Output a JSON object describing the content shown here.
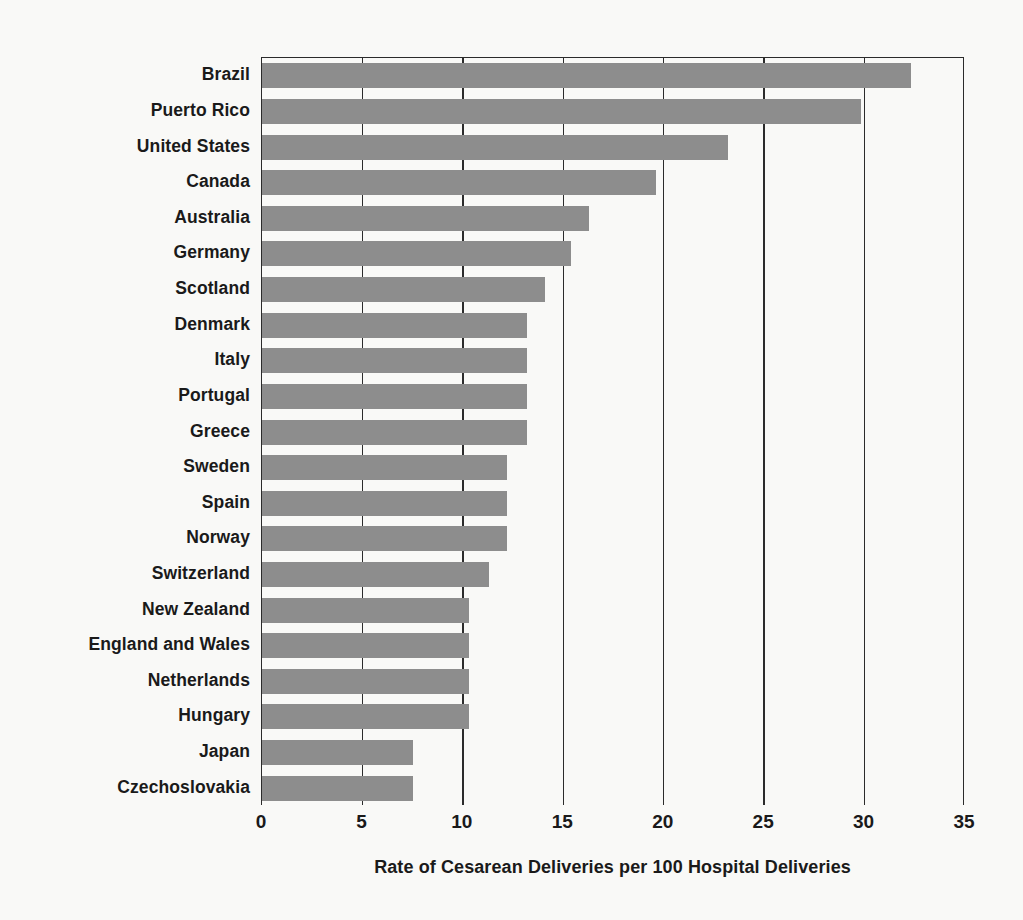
{
  "chart_data": {
    "type": "bar",
    "orientation": "horizontal",
    "title": "",
    "subtitle": "",
    "xlabel": "Rate of Cesarean Deliveries per 100 Hospital Deliveries",
    "ylabel": "",
    "xlim": [
      0,
      35
    ],
    "xticks": [
      0,
      5,
      10,
      15,
      20,
      25,
      30,
      35
    ],
    "xtick_labels": [
      "0",
      "5",
      "10",
      "15",
      "20",
      "25",
      "30",
      "35"
    ],
    "grid": true,
    "grid_axis": "x",
    "legend": null,
    "bar_color": "#8d8d8d",
    "axis_color": "#2b2b2b",
    "background_color": "#f9f9f7",
    "categories": [
      "Brazil",
      "Puerto Rico",
      "United States",
      "Canada",
      "Australia",
      "Germany",
      "Scotland",
      "Denmark",
      "Italy",
      "Portugal",
      "Greece",
      "Sweden",
      "Spain",
      "Norway",
      "Switzerland",
      "New Zealand",
      "England and Wales",
      "Netherlands",
      "Hungary",
      "Japan",
      "Czechoslovakia"
    ],
    "values": [
      32.3,
      29.8,
      23.2,
      19.6,
      16.3,
      15.4,
      14.1,
      13.2,
      13.2,
      13.2,
      13.2,
      12.2,
      12.2,
      12.2,
      11.3,
      10.3,
      10.3,
      10.3,
      10.3,
      7.5,
      7.5
    ]
  }
}
